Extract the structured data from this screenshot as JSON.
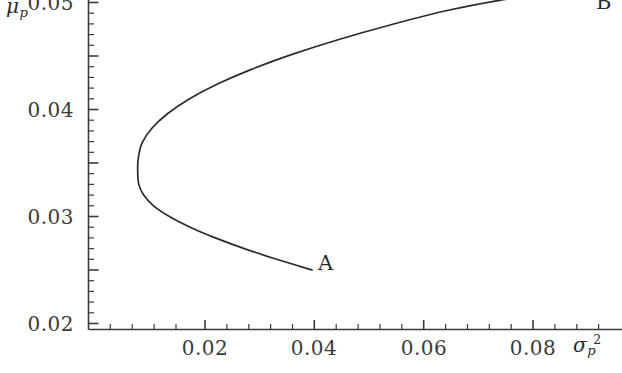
{
  "chart_data": {
    "type": "line",
    "title": "",
    "subtitle": "",
    "xlabel": "sigma_p^2",
    "ylabel": "mu_p",
    "xlabel_parts": {
      "base": "σ",
      "sub": "p",
      "sup": "2"
    },
    "ylabel_parts": {
      "base": "μ",
      "sub": "p",
      "sup": ""
    },
    "xlim": [
      0.0,
      0.0976
    ],
    "ylim": [
      0.0,
      0.05
    ],
    "x_ticks": [
      0.02,
      0.04,
      0.06,
      0.08
    ],
    "x_tick_labels": [
      "0.02",
      "0.04",
      "0.06",
      "0.08"
    ],
    "x_minor_step": 0.004,
    "y_ticks": [
      0.01,
      0.02,
      0.03,
      0.04,
      0.05
    ],
    "y_tick_labels": [
      "0.01",
      "0.02",
      "0.03",
      "0.04",
      "0.05"
    ],
    "y_minor_step": 0.002,
    "grid": false,
    "legend": "none",
    "line_color": "#2b2b2b",
    "axis_color": "#3a3a3a",
    "series": [
      {
        "name": "efficient frontier",
        "comment": "minimum-variance parabola, lower branch from A up to vertex then upper branch to B",
        "points": [
          [
            0.0409,
            0.01
          ],
          [
            0.0344,
            0.0116
          ],
          [
            0.0285,
            0.0132
          ],
          [
            0.0232,
            0.0148
          ],
          [
            0.0186,
            0.0164
          ],
          [
            0.0148,
            0.018
          ],
          [
            0.0119,
            0.0196
          ],
          [
            0.0101,
            0.0212
          ],
          [
            0.0092,
            0.0228
          ],
          [
            0.009,
            0.0248
          ],
          [
            0.0091,
            0.0267
          ],
          [
            0.0098,
            0.029
          ],
          [
            0.0116,
            0.0312
          ],
          [
            0.0145,
            0.0334
          ],
          [
            0.0185,
            0.0356
          ],
          [
            0.0236,
            0.0378
          ],
          [
            0.0298,
            0.04
          ],
          [
            0.0371,
            0.0422
          ],
          [
            0.0455,
            0.0444
          ],
          [
            0.055,
            0.0466
          ],
          [
            0.0656,
            0.0488
          ],
          [
            0.0772,
            0.0506
          ],
          [
            0.0885,
            0.0518
          ],
          [
            0.0922,
            0.0521
          ]
        ]
      }
    ],
    "annotations": [
      {
        "name": "A",
        "label": "A",
        "x": 0.0409,
        "y": 0.01,
        "position": "right"
      },
      {
        "name": "B",
        "label": "B",
        "x": 0.0922,
        "y": 0.0521,
        "position": "right"
      }
    ],
    "vertex": {
      "x": 0.009,
      "y": 0.0248,
      "label": ""
    }
  }
}
